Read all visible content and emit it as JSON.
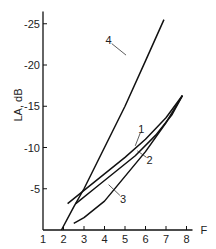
{
  "chart_data": {
    "type": "line",
    "title": "",
    "xlabel": "F",
    "ylabel": "L_A, dB",
    "xlim": [
      1,
      8
    ],
    "ylim": [
      0,
      -25
    ],
    "grid": false,
    "x_ticks": [
      "1",
      "2",
      "3",
      "4",
      "5",
      "6",
      "7",
      "8"
    ],
    "y_ticks": [
      "-5",
      "-10",
      "-15",
      "-20",
      "-25"
    ],
    "series": [
      {
        "name": "1",
        "x": [
          2.2,
          3.0,
          4.0,
          5.0,
          6.0,
          7.0,
          7.8
        ],
        "y": [
          -3.2,
          -4.8,
          -6.8,
          -8.8,
          -11.0,
          -13.6,
          -16.3
        ]
      },
      {
        "name": "2",
        "x": [
          2.6,
          3.5,
          4.5,
          5.5,
          6.5,
          7.3,
          7.8
        ],
        "y": [
          -3.2,
          -5.0,
          -7.0,
          -9.0,
          -11.5,
          -14.0,
          -16.3
        ]
      },
      {
        "name": "3",
        "x": [
          2.5,
          3.0,
          4.0,
          5.0,
          6.0,
          7.0,
          7.8
        ],
        "y": [
          -0.8,
          -1.5,
          -3.5,
          -6.5,
          -9.5,
          -13.0,
          -16.3
        ]
      },
      {
        "name": "4",
        "x": [
          1.9,
          2.5,
          3.0,
          4.0,
          5.0,
          6.0,
          6.9
        ],
        "y": [
          0,
          -2.8,
          -5.0,
          -10.0,
          -15.0,
          -20.5,
          -25.5
        ]
      }
    ],
    "annotations": [
      {
        "text": "1",
        "x": 5.8,
        "y": -12.2
      },
      {
        "text": "2",
        "x": 6.2,
        "y": -8.5
      },
      {
        "text": "3",
        "x": 4.9,
        "y": -3.8
      },
      {
        "text": "4",
        "x": 4.2,
        "y": -23.0
      }
    ]
  }
}
